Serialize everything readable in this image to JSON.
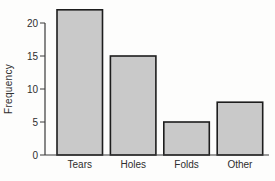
{
  "chart_data": {
    "type": "bar",
    "categories": [
      "Tears",
      "Holes",
      "Folds",
      "Other"
    ],
    "values": [
      22,
      15,
      5,
      8
    ],
    "title": "",
    "xlabel": "",
    "ylabel": "Frequency",
    "ylim": [
      0,
      22.5
    ],
    "yticks": [
      0,
      5,
      10,
      15,
      20
    ],
    "grid": false,
    "legend_position": "none",
    "bar_fill_color": "#c9c9c9",
    "bar_border_color": "#1d1d1d",
    "axis_color": "#3a3a3a",
    "text_color": "#2e2e2e",
    "background_color": "#fdfdfc"
  }
}
